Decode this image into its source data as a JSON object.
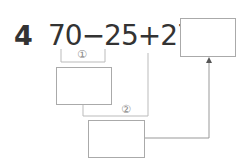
{
  "problem": {
    "number": "4",
    "expression": "70−25+27=",
    "step1_marker": "①",
    "step2_marker": "②"
  },
  "boxes": {
    "answer": "",
    "step1": "",
    "step2": ""
  }
}
